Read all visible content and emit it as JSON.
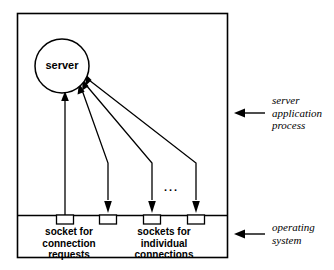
{
  "diagram": {
    "title_text": "server",
    "ellipsis": "...",
    "outer_box": {
      "x": 17,
      "y": 13,
      "w": 211,
      "h": 245
    },
    "divider_y": 215,
    "stroke_color": "#000000",
    "fill_color": "#ffffff",
    "server_node": {
      "label": "server",
      "cx": 62,
      "cy": 66,
      "r": 27
    },
    "sockets": [
      {
        "name": "listening-socket",
        "x": 65
      },
      {
        "name": "connection-socket-1",
        "x": 108
      },
      {
        "name": "connection-socket-2",
        "x": 152
      },
      {
        "name": "connection-socket-3",
        "x": 196
      }
    ],
    "socket_labels": [
      {
        "text": "socket for\nconnection\nrequests",
        "center_x": 69
      },
      {
        "text": "sockets for\nindividual\nconnections",
        "center_x": 164
      }
    ],
    "annotations": [
      {
        "text": "server\napplication\nprocess",
        "arrow": "left-arrow-icon",
        "y": 104
      },
      {
        "text": "operating\nsystem",
        "arrow": "left-arrow-icon",
        "y": 224
      }
    ]
  }
}
